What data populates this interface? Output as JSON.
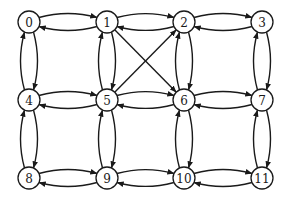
{
  "diagram": {
    "type": "directed-graph",
    "style": {
      "stroke": "#1a1a1a",
      "fill": "#ffffff",
      "node_radius": 11
    },
    "nodes": [
      {
        "id": "0",
        "label": "0",
        "x": 29,
        "y": 22
      },
      {
        "id": "1",
        "label": "1",
        "x": 107,
        "y": 22
      },
      {
        "id": "2",
        "label": "2",
        "x": 184,
        "y": 22
      },
      {
        "id": "3",
        "label": "3",
        "x": 262,
        "y": 22
      },
      {
        "id": "4",
        "label": "4",
        "x": 29,
        "y": 100
      },
      {
        "id": "5",
        "label": "5",
        "x": 107,
        "y": 100
      },
      {
        "id": "6",
        "label": "6",
        "x": 184,
        "y": 100
      },
      {
        "id": "7",
        "label": "7",
        "x": 262,
        "y": 100
      },
      {
        "id": "8",
        "label": "8",
        "x": 29,
        "y": 178
      },
      {
        "id": "9",
        "label": "9",
        "x": 107,
        "y": 178
      },
      {
        "id": "10",
        "label": "10",
        "x": 184,
        "y": 178
      },
      {
        "id": "11",
        "label": "11",
        "x": 262,
        "y": 178
      }
    ],
    "edges": [
      {
        "from": "0",
        "to": "1",
        "curved": true
      },
      {
        "from": "1",
        "to": "0",
        "curved": true
      },
      {
        "from": "1",
        "to": "2",
        "curved": true
      },
      {
        "from": "2",
        "to": "1",
        "curved": true
      },
      {
        "from": "2",
        "to": "3",
        "curved": true
      },
      {
        "from": "3",
        "to": "2",
        "curved": true
      },
      {
        "from": "4",
        "to": "5",
        "curved": true
      },
      {
        "from": "5",
        "to": "4",
        "curved": true
      },
      {
        "from": "5",
        "to": "6",
        "curved": true
      },
      {
        "from": "6",
        "to": "5",
        "curved": true
      },
      {
        "from": "6",
        "to": "7",
        "curved": true
      },
      {
        "from": "7",
        "to": "6",
        "curved": true
      },
      {
        "from": "8",
        "to": "9",
        "curved": true
      },
      {
        "from": "9",
        "to": "8",
        "curved": true
      },
      {
        "from": "9",
        "to": "10",
        "curved": true
      },
      {
        "from": "10",
        "to": "9",
        "curved": true
      },
      {
        "from": "10",
        "to": "11",
        "curved": true
      },
      {
        "from": "11",
        "to": "10",
        "curved": true
      },
      {
        "from": "0",
        "to": "4",
        "curved": true
      },
      {
        "from": "4",
        "to": "0",
        "curved": true
      },
      {
        "from": "4",
        "to": "8",
        "curved": true
      },
      {
        "from": "8",
        "to": "4",
        "curved": true
      },
      {
        "from": "1",
        "to": "5",
        "curved": true
      },
      {
        "from": "5",
        "to": "1",
        "curved": true
      },
      {
        "from": "5",
        "to": "9",
        "curved": true
      },
      {
        "from": "9",
        "to": "5",
        "curved": true
      },
      {
        "from": "2",
        "to": "6",
        "curved": true
      },
      {
        "from": "6",
        "to": "2",
        "curved": true
      },
      {
        "from": "6",
        "to": "10",
        "curved": true
      },
      {
        "from": "10",
        "to": "6",
        "curved": true
      },
      {
        "from": "3",
        "to": "7",
        "curved": true
      },
      {
        "from": "7",
        "to": "3",
        "curved": true
      },
      {
        "from": "7",
        "to": "11",
        "curved": true
      },
      {
        "from": "11",
        "to": "7",
        "curved": true
      },
      {
        "from": "1",
        "to": "6",
        "curved": false
      },
      {
        "from": "5",
        "to": "2",
        "curved": false
      }
    ]
  }
}
